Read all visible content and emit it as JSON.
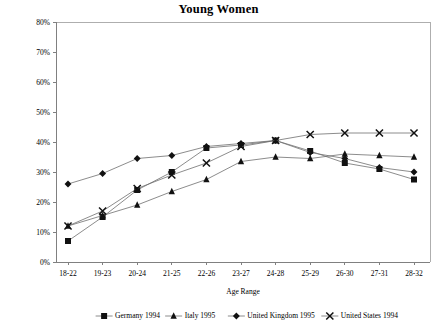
{
  "chart_data": {
    "type": "line",
    "title": "Young Women",
    "xlabel": "Age Range",
    "ylabel": "",
    "categories": [
      "18-22",
      "19-23",
      "20-24",
      "21-25",
      "22-26",
      "23-27",
      "24-28",
      "25-29",
      "26-30",
      "27-31",
      "28-32"
    ],
    "ylim": [
      0,
      80
    ],
    "ytick_labels": [
      "0%",
      "10%",
      "20%",
      "30%",
      "40%",
      "50%",
      "60%",
      "70%",
      "80%"
    ],
    "ytick_values": [
      0,
      10,
      20,
      30,
      40,
      50,
      60,
      70,
      80
    ],
    "grid": false,
    "legend_position": "bottom",
    "series": [
      {
        "name": "Germany 1994",
        "marker": "square",
        "values": [
          7,
          15,
          24,
          30,
          38,
          39,
          40.5,
          37,
          33,
          31,
          27.5
        ]
      },
      {
        "name": "Italy 1995",
        "marker": "triangle",
        "values": [
          12,
          15.5,
          19,
          23.5,
          27.5,
          33.5,
          35,
          34.5,
          36,
          35.5,
          35
        ]
      },
      {
        "name": "United Kingdom 1995",
        "marker": "diamond",
        "values": [
          26,
          29.5,
          34.5,
          35.5,
          38.5,
          39.5,
          40.5,
          36.5,
          34.5,
          31.5,
          30
        ]
      },
      {
        "name": "United States 1994",
        "marker": "x",
        "values": [
          12,
          17,
          24.5,
          29,
          33,
          38.5,
          40.5,
          42.5,
          43,
          43,
          43
        ]
      }
    ]
  },
  "colors": {
    "marker": "#111111",
    "line": "#6e6e6e",
    "axis": "#808080",
    "text": "#000000",
    "background": "#ffffff"
  }
}
